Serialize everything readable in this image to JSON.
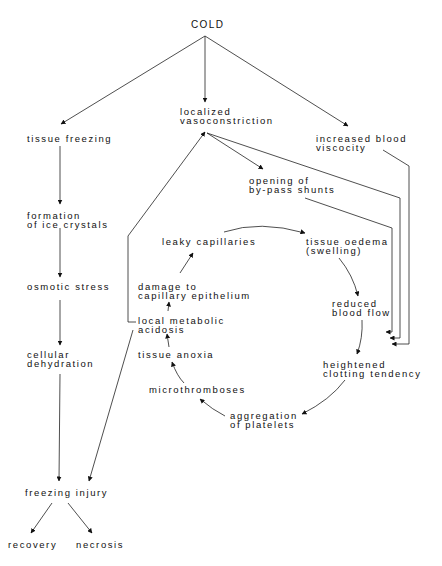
{
  "diagram": {
    "root": "COLD",
    "nodes": {
      "cold": {
        "lines": [
          "COLD"
        ]
      },
      "tissue_freezing": {
        "lines": [
          "tissue freezing"
        ]
      },
      "localized_vasoconstriction": {
        "lines": [
          "localized",
          "vasoconstriction"
        ]
      },
      "increased_blood_viscocity": {
        "lines": [
          "increased blood",
          "viscocity"
        ]
      },
      "opening_of_bypass_shunts": {
        "lines": [
          "opening of",
          "by-pass shunts"
        ]
      },
      "formation_of_ice_crystals": {
        "lines": [
          "formation",
          "of ice crystals"
        ]
      },
      "leaky_capillaries": {
        "lines": [
          "leaky capillaries"
        ]
      },
      "tissue_oedema": {
        "lines": [
          "tissue oedema",
          "(swelling)"
        ]
      },
      "osmotic_stress": {
        "lines": [
          "osmotic stress"
        ]
      },
      "damage_to_capillary_epithelium": {
        "lines": [
          "damage to",
          "capillary epithelium"
        ]
      },
      "reduced_blood_flow": {
        "lines": [
          "reduced",
          "blood flow"
        ]
      },
      "local_metabolic_acidosis": {
        "lines": [
          "local metabolic",
          "acidosis"
        ]
      },
      "cellular_dehydration": {
        "lines": [
          "cellular",
          "dehydration"
        ]
      },
      "tissue_anoxia": {
        "lines": [
          "tissue anoxia"
        ]
      },
      "heightened_clotting_tendency": {
        "lines": [
          "heightened",
          "clotting tendency"
        ]
      },
      "microthromboses": {
        "lines": [
          "microthromboses"
        ]
      },
      "aggregation_of_platelets": {
        "lines": [
          "aggregation",
          "of platelets"
        ]
      },
      "freezing_injury": {
        "lines": [
          "freezing injury"
        ]
      },
      "recovery": {
        "lines": [
          "recovery"
        ]
      },
      "necrosis": {
        "lines": [
          "necrosis"
        ]
      }
    },
    "edges": [
      [
        "cold",
        "tissue_freezing"
      ],
      [
        "cold",
        "localized_vasoconstriction"
      ],
      [
        "cold",
        "increased_blood_viscocity"
      ],
      [
        "tissue_freezing",
        "formation_of_ice_crystals"
      ],
      [
        "formation_of_ice_crystals",
        "osmotic_stress"
      ],
      [
        "osmotic_stress",
        "cellular_dehydration"
      ],
      [
        "cellular_dehydration",
        "freezing_injury"
      ],
      [
        "freezing_injury",
        "recovery"
      ],
      [
        "freezing_injury",
        "necrosis"
      ],
      [
        "localized_vasoconstriction",
        "opening_of_bypass_shunts"
      ],
      [
        "localized_vasoconstriction",
        "reduced_blood_flow"
      ],
      [
        "opening_of_bypass_shunts",
        "reduced_blood_flow"
      ],
      [
        "increased_blood_viscocity",
        "reduced_blood_flow"
      ],
      [
        "leaky_capillaries",
        "tissue_oedema"
      ],
      [
        "tissue_oedema",
        "reduced_blood_flow"
      ],
      [
        "reduced_blood_flow",
        "heightened_clotting_tendency"
      ],
      [
        "heightened_clotting_tendency",
        "aggregation_of_platelets"
      ],
      [
        "aggregation_of_platelets",
        "microthromboses"
      ],
      [
        "microthromboses",
        "tissue_anoxia"
      ],
      [
        "tissue_anoxia",
        "local_metabolic_acidosis"
      ],
      [
        "local_metabolic_acidosis",
        "damage_to_capillary_epithelium"
      ],
      [
        "damage_to_capillary_epithelium",
        "leaky_capillaries"
      ],
      [
        "local_metabolic_acidosis",
        "localized_vasoconstriction"
      ],
      [
        "local_metabolic_acidosis",
        "freezing_injury"
      ]
    ]
  }
}
